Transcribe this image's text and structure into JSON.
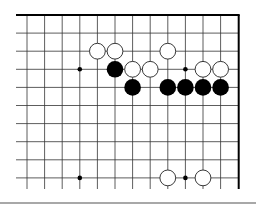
{
  "board": {
    "description": "Go board diagram, top-right corner region",
    "origin_x": 27,
    "origin_y": 15,
    "spacing_x": 17.6,
    "spacing_y": 18.1,
    "columns": 13,
    "rows": 10,
    "left_line_start": 16,
    "bottom_line_end": 189,
    "edges": [
      "top",
      "right"
    ],
    "line_color": "#333333",
    "edge_color": "#000000",
    "star_points": [
      {
        "col": 3,
        "row": 3
      },
      {
        "col": 9,
        "row": 3
      },
      {
        "col": 3,
        "row": 9
      },
      {
        "col": 9,
        "row": 9
      }
    ],
    "stones": [
      {
        "color": "white",
        "col": 4,
        "row": 2
      },
      {
        "color": "white",
        "col": 5,
        "row": 2
      },
      {
        "color": "white",
        "col": 8,
        "row": 2
      },
      {
        "color": "black",
        "col": 5,
        "row": 3
      },
      {
        "color": "white",
        "col": 6,
        "row": 3
      },
      {
        "color": "white",
        "col": 7,
        "row": 3
      },
      {
        "color": "white",
        "col": 10,
        "row": 3
      },
      {
        "color": "white",
        "col": 11,
        "row": 3
      },
      {
        "color": "black",
        "col": 6,
        "row": 4
      },
      {
        "color": "black",
        "col": 8,
        "row": 4
      },
      {
        "color": "black",
        "col": 9,
        "row": 4
      },
      {
        "color": "black",
        "col": 10,
        "row": 4
      },
      {
        "color": "black",
        "col": 11,
        "row": 4
      },
      {
        "color": "white",
        "col": 8,
        "row": 9
      },
      {
        "color": "white",
        "col": 10,
        "row": 9
      }
    ]
  },
  "colors": {
    "black_stone": "#000000",
    "white_stone_fill": "#ffffff",
    "white_stone_stroke": "#222222",
    "separator": "#a8a8a8"
  }
}
